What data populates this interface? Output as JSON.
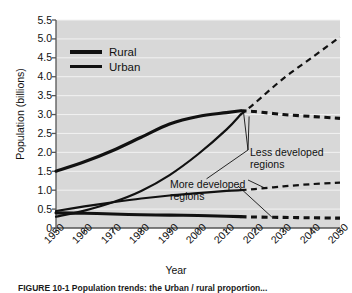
{
  "figure": {
    "caption": "FIGURE 10-1 Population trends: the Urban / rural proportion...",
    "background": "#d8d8d8",
    "line_color": "#111111"
  },
  "chart_data": {
    "type": "line",
    "title": "",
    "xlabel": "Year",
    "ylabel": "Population (billions)",
    "xlim": [
      1950,
      2050
    ],
    "ylim": [
      0,
      5.5
    ],
    "ytick_step": 0.5,
    "grid": true,
    "grid_orientation": "horizontal",
    "x": [
      1950,
      1960,
      1970,
      1980,
      1990,
      2000,
      2010,
      2020,
      2030,
      2040,
      2050
    ],
    "xticks": [
      "1950",
      "1960",
      "1970",
      "1980",
      "1990",
      "2000",
      "2010",
      "2020",
      "2030",
      "2040",
      "2050"
    ],
    "yticks": [
      "0",
      "0.5",
      "1.0",
      "1.5",
      "2.0",
      "2.5",
      "3.0",
      "3.5",
      "4.0",
      "4.5",
      "5.0",
      "5.5"
    ],
    "legend": {
      "position": "top-left",
      "entries": [
        {
          "label": "Rural",
          "style": "solid-thick"
        },
        {
          "label": "Urban",
          "style": "solid-thin"
        }
      ]
    },
    "annotations": [
      {
        "text": "Less developed regions",
        "x": 2022,
        "y": 2.5
      },
      {
        "text": "More developed regions",
        "x": 2000,
        "y": 1.55
      }
    ],
    "series": [
      {
        "name": "Rural — less developed regions",
        "group": "Less developed regions",
        "type": "Rural",
        "style": "solid-thick",
        "projection_from": 2015,
        "x": [
          1950,
          1960,
          1970,
          1980,
          1990,
          2000,
          2010,
          2015,
          2020,
          2030,
          2040,
          2050
        ],
        "values": [
          1.5,
          1.75,
          2.05,
          2.4,
          2.75,
          2.95,
          3.05,
          3.1,
          3.08,
          3.0,
          2.95,
          2.9
        ]
      },
      {
        "name": "Urban — less developed regions",
        "group": "Less developed regions",
        "type": "Urban",
        "style": "solid-thin",
        "projection_from": 2015,
        "x": [
          1950,
          1960,
          1970,
          1980,
          1990,
          2000,
          2010,
          2015,
          2020,
          2030,
          2040,
          2050
        ],
        "values": [
          0.3,
          0.46,
          0.68,
          0.98,
          1.4,
          1.95,
          2.6,
          3.0,
          3.3,
          3.95,
          4.5,
          5.05
        ]
      },
      {
        "name": "Urban — more developed regions",
        "group": "More developed regions",
        "type": "Urban",
        "style": "solid-thin",
        "projection_from": 2015,
        "x": [
          1950,
          1960,
          1970,
          1980,
          1990,
          2000,
          2010,
          2015,
          2020,
          2030,
          2040,
          2050
        ],
        "values": [
          0.45,
          0.57,
          0.68,
          0.78,
          0.86,
          0.92,
          0.98,
          1.0,
          1.03,
          1.1,
          1.16,
          1.2
        ]
      },
      {
        "name": "Rural — more developed regions",
        "group": "More developed regions",
        "type": "Rural",
        "style": "solid-thick",
        "projection_from": 2015,
        "x": [
          1950,
          1960,
          1970,
          1980,
          1990,
          2000,
          2010,
          2015,
          2020,
          2030,
          2040,
          2050
        ],
        "values": [
          0.4,
          0.39,
          0.37,
          0.35,
          0.34,
          0.33,
          0.31,
          0.3,
          0.29,
          0.28,
          0.27,
          0.26
        ]
      }
    ]
  }
}
